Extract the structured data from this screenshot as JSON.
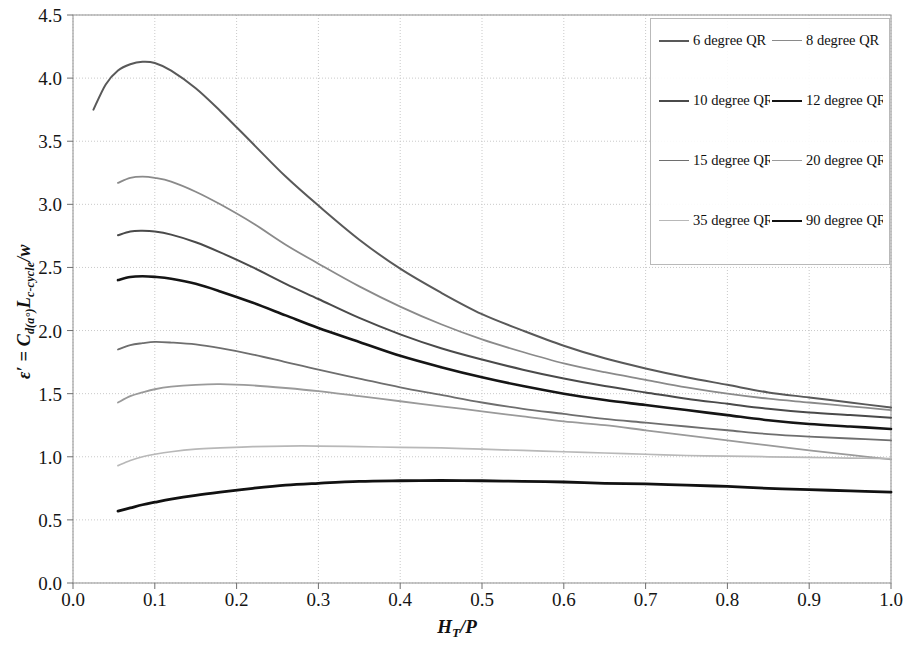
{
  "chart_data": {
    "type": "line",
    "title": "",
    "xlabel": "H_T/P",
    "ylabel": "ε' = C_d(a°)L_c-cycle/w",
    "xlim": [
      0.0,
      1.0
    ],
    "ylim": [
      0.0,
      4.5
    ],
    "grid": true,
    "legend_position": "top-right",
    "xticks": [
      "0.0",
      "0.1",
      "0.2",
      "0.3",
      "0.4",
      "0.5",
      "0.6",
      "0.7",
      "0.8",
      "0.9",
      "1.0"
    ],
    "yticks": [
      "0.0",
      "0.5",
      "1.0",
      "1.5",
      "2.0",
      "2.5",
      "3.0",
      "3.5",
      "4.0",
      "4.5"
    ],
    "xtick_values": [
      0.0,
      0.1,
      0.2,
      0.3,
      0.4,
      0.5,
      0.6,
      0.7,
      0.8,
      0.9,
      1.0
    ],
    "ytick_values": [
      0.0,
      0.5,
      1.0,
      1.5,
      2.0,
      2.5,
      3.0,
      3.5,
      4.0,
      4.5
    ],
    "series": [
      {
        "name": "6 degree QR",
        "color": "#595959",
        "width": 2.0,
        "x": [
          0.025,
          0.04,
          0.055,
          0.07,
          0.085,
          0.1,
          0.12,
          0.15,
          0.18,
          0.22,
          0.26,
          0.3,
          0.35,
          0.4,
          0.45,
          0.5,
          0.55,
          0.6,
          0.65,
          0.7,
          0.75,
          0.8,
          0.85,
          0.9,
          0.95,
          1.0
        ],
        "y": [
          3.75,
          3.95,
          4.06,
          4.11,
          4.13,
          4.12,
          4.06,
          3.92,
          3.74,
          3.48,
          3.22,
          2.99,
          2.72,
          2.49,
          2.3,
          2.13,
          2.0,
          1.88,
          1.78,
          1.7,
          1.63,
          1.57,
          1.51,
          1.47,
          1.43,
          1.39
        ]
      },
      {
        "name": "8 degree QR",
        "color": "#8a8a8a",
        "width": 1.8,
        "x": [
          0.055,
          0.07,
          0.085,
          0.1,
          0.12,
          0.15,
          0.18,
          0.22,
          0.26,
          0.3,
          0.35,
          0.4,
          0.45,
          0.5,
          0.55,
          0.6,
          0.65,
          0.7,
          0.75,
          0.8,
          0.85,
          0.9,
          0.95,
          1.0
        ],
        "y": [
          3.17,
          3.21,
          3.22,
          3.21,
          3.18,
          3.1,
          3.0,
          2.85,
          2.68,
          2.53,
          2.35,
          2.19,
          2.05,
          1.93,
          1.83,
          1.74,
          1.67,
          1.61,
          1.55,
          1.5,
          1.46,
          1.43,
          1.4,
          1.37
        ]
      },
      {
        "name": "10 degree QR",
        "color": "#4a4a4a",
        "width": 2.0,
        "x": [
          0.055,
          0.07,
          0.085,
          0.1,
          0.12,
          0.15,
          0.18,
          0.22,
          0.26,
          0.3,
          0.35,
          0.4,
          0.45,
          0.5,
          0.55,
          0.6,
          0.65,
          0.7,
          0.75,
          0.8,
          0.85,
          0.9,
          0.95,
          1.0
        ],
        "y": [
          2.755,
          2.785,
          2.79,
          2.785,
          2.76,
          2.7,
          2.62,
          2.5,
          2.37,
          2.25,
          2.1,
          1.97,
          1.86,
          1.77,
          1.69,
          1.62,
          1.56,
          1.51,
          1.46,
          1.42,
          1.38,
          1.35,
          1.33,
          1.31
        ]
      },
      {
        "name": "12 degree QR",
        "color": "#151515",
        "width": 2.6,
        "x": [
          0.055,
          0.07,
          0.085,
          0.1,
          0.12,
          0.15,
          0.18,
          0.22,
          0.26,
          0.3,
          0.35,
          0.4,
          0.45,
          0.5,
          0.55,
          0.6,
          0.65,
          0.7,
          0.75,
          0.8,
          0.85,
          0.9,
          0.95,
          1.0
        ],
        "y": [
          2.4,
          2.425,
          2.43,
          2.425,
          2.41,
          2.37,
          2.31,
          2.22,
          2.12,
          2.02,
          1.91,
          1.8,
          1.71,
          1.63,
          1.56,
          1.5,
          1.45,
          1.41,
          1.37,
          1.33,
          1.29,
          1.26,
          1.24,
          1.22
        ]
      },
      {
        "name": "15 degree QR",
        "color": "#6e6e6e",
        "width": 1.8,
        "x": [
          0.055,
          0.07,
          0.085,
          0.1,
          0.12,
          0.15,
          0.18,
          0.22,
          0.26,
          0.3,
          0.35,
          0.4,
          0.45,
          0.5,
          0.55,
          0.6,
          0.65,
          0.7,
          0.75,
          0.8,
          0.85,
          0.9,
          0.95,
          1.0
        ],
        "y": [
          1.85,
          1.885,
          1.9,
          1.91,
          1.905,
          1.89,
          1.86,
          1.81,
          1.75,
          1.69,
          1.62,
          1.55,
          1.49,
          1.43,
          1.38,
          1.34,
          1.3,
          1.27,
          1.24,
          1.21,
          1.18,
          1.16,
          1.145,
          1.13
        ]
      },
      {
        "name": "20 degree QR",
        "color": "#9a9a9a",
        "width": 1.8,
        "x": [
          0.055,
          0.07,
          0.085,
          0.1,
          0.12,
          0.15,
          0.18,
          0.22,
          0.26,
          0.3,
          0.35,
          0.4,
          0.45,
          0.5,
          0.55,
          0.6,
          0.65,
          0.7,
          0.75,
          0.8,
          0.85,
          0.9,
          0.95,
          1.0
        ],
        "y": [
          1.43,
          1.48,
          1.51,
          1.535,
          1.555,
          1.57,
          1.575,
          1.565,
          1.545,
          1.52,
          1.48,
          1.44,
          1.4,
          1.36,
          1.32,
          1.28,
          1.25,
          1.21,
          1.17,
          1.13,
          1.09,
          1.05,
          1.015,
          0.98
        ]
      },
      {
        "name": "35 degree QR",
        "color": "#b8b8b8",
        "width": 1.7,
        "x": [
          0.055,
          0.07,
          0.085,
          0.1,
          0.12,
          0.15,
          0.18,
          0.22,
          0.26,
          0.3,
          0.35,
          0.4,
          0.45,
          0.5,
          0.55,
          0.6,
          0.65,
          0.7,
          0.75,
          0.8,
          0.85,
          0.9,
          0.95,
          1.0
        ],
        "y": [
          0.93,
          0.97,
          1.0,
          1.02,
          1.04,
          1.06,
          1.07,
          1.08,
          1.085,
          1.085,
          1.08,
          1.075,
          1.07,
          1.06,
          1.05,
          1.04,
          1.03,
          1.02,
          1.01,
          1.005,
          1.0,
          0.995,
          0.99,
          0.985
        ]
      },
      {
        "name": "90 degree QR",
        "color": "#111111",
        "width": 2.8,
        "x": [
          0.055,
          0.07,
          0.085,
          0.1,
          0.12,
          0.15,
          0.18,
          0.22,
          0.26,
          0.3,
          0.35,
          0.4,
          0.45,
          0.5,
          0.55,
          0.6,
          0.65,
          0.7,
          0.75,
          0.8,
          0.85,
          0.9,
          0.95,
          1.0
        ],
        "y": [
          0.57,
          0.595,
          0.62,
          0.64,
          0.665,
          0.695,
          0.72,
          0.75,
          0.775,
          0.79,
          0.805,
          0.81,
          0.812,
          0.81,
          0.805,
          0.8,
          0.79,
          0.785,
          0.775,
          0.765,
          0.75,
          0.74,
          0.73,
          0.72
        ]
      }
    ]
  },
  "axes": {
    "y_title_main": "ε′ = C",
    "y_title_sub1": "d(a°)",
    "y_title_mid": "L",
    "y_title_sub2": "c-cycle",
    "y_title_end": "/w",
    "x_title_main": "H",
    "x_title_sub": "T",
    "x_title_end": "/P"
  },
  "legend": {
    "entries": [
      {
        "label": "6 degree QR",
        "color": "#595959",
        "width": 2.0
      },
      {
        "label": "8 degree QR",
        "color": "#8a8a8a",
        "width": 1.6
      },
      {
        "label": "10 degree QR",
        "color": "#4a4a4a",
        "width": 2.0
      },
      {
        "label": "12 degree QR",
        "color": "#151515",
        "width": 2.8
      },
      {
        "label": "15 degree QR",
        "color": "#6e6e6e",
        "width": 1.6
      },
      {
        "label": "20 degree QR",
        "color": "#9a9a9a",
        "width": 1.6
      },
      {
        "label": "35 degree QR",
        "color": "#b8b8b8",
        "width": 1.5
      },
      {
        "label": "90 degree QR",
        "color": "#111111",
        "width": 2.8
      }
    ]
  },
  "style": {
    "grid_color": "#c9c9c9",
    "border_color": "#9a9a9a",
    "background": "#ffffff"
  }
}
